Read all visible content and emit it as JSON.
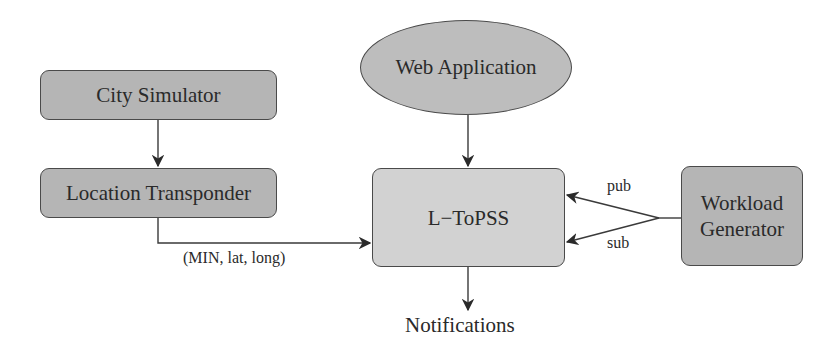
{
  "diagram": {
    "nodes": {
      "city_simulator": {
        "label": "City Simulator",
        "shape": "rounded-rect",
        "fill": "#b5b5b5"
      },
      "location_transponder": {
        "label": "Location Transponder",
        "shape": "rounded-rect",
        "fill": "#b5b5b5"
      },
      "web_application": {
        "label": "Web Application",
        "shape": "ellipse",
        "fill": "#bdbdbd"
      },
      "l_topss": {
        "label": "L−ToPSS",
        "shape": "rounded-rect",
        "fill": "#d2d2d2"
      },
      "workload_generator": {
        "line1": "Workload",
        "line2": "Generator",
        "shape": "rounded-rect",
        "fill": "#b5b5b5"
      },
      "notifications": {
        "label": "Notifications",
        "shape": "text"
      }
    },
    "edges": [
      {
        "from": "City Simulator",
        "to": "Location Transponder",
        "label": ""
      },
      {
        "from": "Location Transponder",
        "to": "L-ToPSS",
        "label": "(MIN, lat, long)"
      },
      {
        "from": "Web Application",
        "to": "L-ToPSS",
        "label": ""
      },
      {
        "from": "Workload Generator",
        "to": "L-ToPSS",
        "label": "pub"
      },
      {
        "from": "Workload Generator",
        "to": "L-ToPSS",
        "label": "sub"
      },
      {
        "from": "L-ToPSS",
        "to": "Notifications",
        "label": ""
      }
    ],
    "edge_labels": {
      "min_lat_long": "(MIN, lat, long)",
      "pub": "pub",
      "sub": "sub"
    },
    "colors": {
      "stroke": "#4a4a4a",
      "dark_fill": "#b5b5b5",
      "light_fill": "#d2d2d2",
      "ellipse_fill": "#bdbdbd"
    }
  }
}
